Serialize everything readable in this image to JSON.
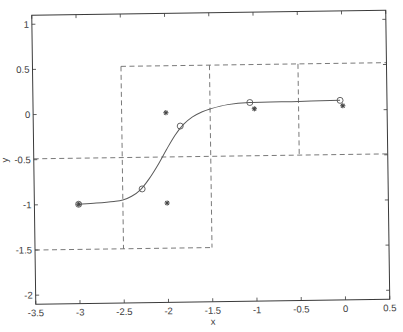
{
  "chart_data": {
    "type": "line",
    "title": "",
    "xlabel": "x",
    "ylabel": "y",
    "xlim": [
      -3.5,
      0.5
    ],
    "ylim": [
      -2.1,
      1.1
    ],
    "grid": false,
    "legend": null,
    "x_ticks": [
      -3.5,
      -3,
      -2.5,
      -2,
      -1.5,
      -1,
      -0.5,
      0,
      0.5
    ],
    "x_tick_labels": [
      "-3.5",
      "-3",
      "-2.5",
      "-2",
      "-1.5",
      "-1",
      "-0.5",
      "0",
      "0.5"
    ],
    "y_ticks": [
      -2,
      -1.5,
      -1,
      -0.5,
      0,
      0.5,
      1
    ],
    "y_tick_labels": [
      "-2",
      "-1.5",
      "-1",
      "-0.5",
      "0",
      "0.5",
      "1"
    ],
    "series": [
      {
        "name": "model-curve",
        "style": "solid-line",
        "x": [
          -3.0,
          -2.8,
          -2.6,
          -2.5,
          -2.4,
          -2.3,
          -2.2,
          -2.1,
          -2.0,
          -1.9,
          -1.8,
          -1.7,
          -1.6,
          -1.5,
          -1.3,
          -1.05,
          -0.5,
          -0.03
        ],
        "y": [
          -1.0,
          -0.99,
          -0.975,
          -0.96,
          -0.92,
          -0.85,
          -0.73,
          -0.58,
          -0.41,
          -0.25,
          -0.13,
          -0.05,
          0.0,
          0.035,
          0.08,
          0.1,
          0.105,
          0.11
        ]
      },
      {
        "name": "circle-markers",
        "style": "open-circle",
        "x": [
          -3.0,
          -2.28,
          -1.84,
          -1.05,
          -0.03
        ],
        "y": [
          -1.0,
          -0.84,
          -0.15,
          0.1,
          0.11
        ]
      },
      {
        "name": "asterisk-markers",
        "style": "asterisk",
        "x": [
          -3.0,
          -2.0,
          -2.0,
          -1.0,
          0.0
        ],
        "y": [
          -1.0,
          0.0,
          -1.0,
          0.03,
          0.05
        ]
      }
    ],
    "dashed_segments": [
      {
        "name": "top-boundary",
        "x": [
          -2.5,
          0.5
        ],
        "y": [
          0.52,
          0.52
        ]
      },
      {
        "name": "middle-boundary",
        "x": [
          -3.5,
          0.5
        ],
        "y": [
          -0.49,
          -0.49
        ]
      },
      {
        "name": "bottom-boundary",
        "x": [
          -3.5,
          -1.5
        ],
        "y": [
          -1.5,
          -1.5
        ]
      },
      {
        "name": "vertical-left",
        "x": [
          -2.5,
          -2.5
        ],
        "y": [
          0.52,
          -1.5
        ]
      },
      {
        "name": "vertical-middle",
        "x": [
          -1.5,
          -1.5
        ],
        "y": [
          0.52,
          -1.5
        ]
      },
      {
        "name": "vertical-right",
        "x": [
          -0.5,
          -0.5
        ],
        "y": [
          0.52,
          -0.49
        ]
      }
    ],
    "colors": {
      "axis": "#3a3a3a",
      "curve": "#5a5a5a",
      "dashed": "#6a6a6a",
      "marker": "#555555",
      "background": "#ffffff"
    }
  }
}
